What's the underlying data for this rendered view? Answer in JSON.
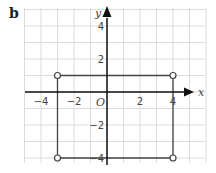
{
  "figure": {
    "label": "b"
  },
  "chart_data": {
    "type": "scatter",
    "title": "",
    "xlabel": "x",
    "ylabel": "y",
    "origin_label": "O",
    "xlim": [
      -5,
      5
    ],
    "ylim": [
      -4,
      5
    ],
    "grid": true,
    "grid_step": 1,
    "x_ticks": [
      -4,
      -2,
      2,
      4
    ],
    "y_ticks": [
      4,
      2,
      -2,
      -4
    ],
    "x_tick_labels": [
      "−4",
      "−2",
      "2",
      "4"
    ],
    "y_tick_labels": [
      "4",
      "2",
      "−2",
      "−4"
    ],
    "series": [
      {
        "name": "rectangle",
        "shape": "closed-polygon",
        "marker": "open-circle",
        "points": [
          [
            -3,
            1
          ],
          [
            4,
            1
          ],
          [
            4,
            -4
          ],
          [
            -3,
            -4
          ]
        ]
      }
    ],
    "colors": {
      "grid": "#dcdcdc",
      "axes": "#111111",
      "shape": "#444444"
    }
  }
}
